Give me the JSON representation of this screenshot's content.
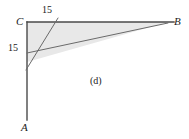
{
  "figure": {
    "part_label": "(d)",
    "background_color": "#ffffff",
    "stroke_color": "#4a4a4a",
    "shade_color": "#e8e8e8",
    "vertices": [
      {
        "name": "C",
        "label": "C",
        "x": 27,
        "y": 22,
        "role": "right-angle-corner"
      },
      {
        "name": "B",
        "label": "B",
        "x": 168,
        "y": 22,
        "role": "ray-end-right"
      },
      {
        "name": "A",
        "label": "A",
        "x": 27,
        "y": 128,
        "role": "ray-end-down"
      }
    ],
    "measurements": [
      {
        "name": "top-segment",
        "label": "15",
        "x": 48,
        "y": 11,
        "along": "CB"
      },
      {
        "name": "left-segment",
        "label": "15",
        "x": 14,
        "y": 48,
        "along": "CA"
      }
    ],
    "segments": [
      {
        "name": "ray-CB",
        "x1": 27,
        "y1": 22,
        "x2": 174,
        "y2": 22,
        "width": 1.4
      },
      {
        "name": "ray-CA",
        "x1": 27,
        "y1": 22,
        "x2": 27,
        "y2": 120,
        "width": 1.4
      },
      {
        "name": "hypotenuse-to-B",
        "x1": 27,
        "y1": 53,
        "x2": 168,
        "y2": 23,
        "width": 1.0
      },
      {
        "name": "diagonal-15-mark",
        "x1": 26,
        "y1": 70,
        "x2": 58,
        "y2": 18,
        "width": 1.0
      }
    ],
    "shaded_region": {
      "name": "shaded-triangle",
      "points": "27,22 168,22 27,62",
      "fill": "#e8e8e8"
    }
  }
}
